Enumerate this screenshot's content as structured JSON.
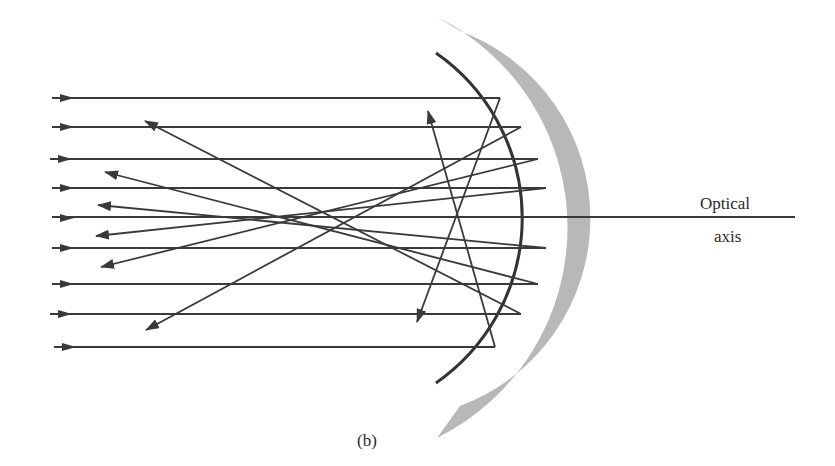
{
  "figure": {
    "caption": "(b)",
    "axis_label_line1": "Optical",
    "axis_label_line2": "axis"
  },
  "colors": {
    "ray": "#3a3a3a",
    "mirror_surface": "#333333",
    "mirror_backing": "#b8b8b8",
    "background": "#ffffff"
  },
  "incident_rays_y": [
    98,
    127,
    159,
    188,
    218,
    248,
    284,
    314,
    347
  ],
  "reflected_rays": [
    {
      "from": [
        500,
        98
      ],
      "to": [
        415,
        325
      ]
    },
    {
      "from": [
        521,
        127
      ],
      "to": [
        145,
        330
      ]
    },
    {
      "from": [
        538,
        159
      ],
      "to": [
        100,
        268
      ]
    },
    {
      "from": [
        546,
        188
      ],
      "to": [
        95,
        235
      ]
    },
    {
      "from": [
        546,
        248
      ],
      "to": [
        98,
        205
      ]
    },
    {
      "from": [
        538,
        284
      ],
      "to": [
        105,
        172
      ]
    },
    {
      "from": [
        521,
        314
      ],
      "to": [
        145,
        120
      ]
    },
    {
      "from": [
        495,
        347
      ],
      "to": [
        428,
        110
      ]
    }
  ]
}
